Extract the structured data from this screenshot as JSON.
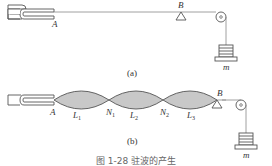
{
  "figure": {
    "panel_a": {
      "label": "(a)",
      "point_A": "A",
      "point_B": "B",
      "mass": "m"
    },
    "panel_b": {
      "label": "(b)",
      "point_A": "A",
      "point_B": "B",
      "nodes": [
        "N",
        "N"
      ],
      "node_subs": [
        "1",
        "2"
      ],
      "segments": [
        "L",
        "L",
        "L"
      ],
      "segment_subs": [
        "1",
        "2",
        "3"
      ],
      "mass": "m"
    },
    "caption": "图 1-28  驻波的产生"
  },
  "colors": {
    "line": "#555555",
    "fill": "#c8c8c8",
    "text": "#333333"
  }
}
